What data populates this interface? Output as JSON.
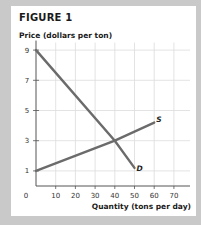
{
  "figure": {
    "title": "FIGURE 1",
    "ylabel": "Price (dollars per ton)",
    "xlabel": "Quantity (tons per day)"
  },
  "colors": {
    "background": "#c9c9c9",
    "panel": "#ffffff",
    "curve": "#6b6b6b",
    "grid": "#dcdcdc",
    "axis": "#555555"
  },
  "chart_data": {
    "type": "line",
    "title": "FIGURE 1",
    "xlabel": "Quantity (tons per day)",
    "ylabel": "Price (dollars per ton)",
    "xlim": [
      0,
      75
    ],
    "ylim": [
      0,
      9.5
    ],
    "x_ticks": [
      0,
      10,
      20,
      30,
      40,
      50,
      60,
      70
    ],
    "y_ticks": [
      1,
      3,
      5,
      7,
      9
    ],
    "grid": true,
    "series": [
      {
        "name": "D",
        "label": "D",
        "x": [
          0,
          40,
          50
        ],
        "y": [
          9,
          3,
          1.2
        ]
      },
      {
        "name": "S",
        "label": "S",
        "x": [
          0,
          40,
          60
        ],
        "y": [
          1,
          3,
          4.2
        ]
      }
    ],
    "annotations": [
      {
        "text": "D",
        "x": 51,
        "y": 1.1
      },
      {
        "text": "S",
        "x": 61,
        "y": 4.4
      }
    ],
    "equilibrium": {
      "x": 40,
      "y": 3
    }
  }
}
